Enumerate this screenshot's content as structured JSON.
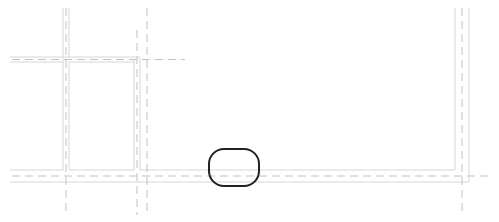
{
  "drawing": {
    "type": "architectural-plan-fragment",
    "colors": {
      "wall_line": "#d4d4d4",
      "center_line": "#c4c4c4",
      "highlight": "#222222",
      "background": "#ffffff"
    },
    "highlight_marker": {
      "shape": "rounded-rectangle",
      "x": 209,
      "y": 149,
      "width": 50,
      "height": 37,
      "radius": 15
    }
  }
}
